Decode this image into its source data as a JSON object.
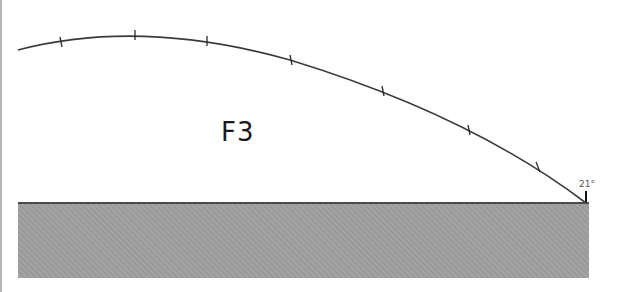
{
  "figure": {
    "label": "F3",
    "landing_label": "21°",
    "colors": {
      "trajectory": "#3a3a3a",
      "ground": "#a0a0a0",
      "ground_edge": "#4a4a4a",
      "frame": "#b5b5b5"
    },
    "trajectory": {
      "start": [
        18,
        50
      ],
      "apex": [
        135,
        35
      ],
      "end": [
        585,
        203
      ],
      "tick_positions": [
        [
          61,
          42
        ],
        [
          135,
          35
        ],
        [
          207,
          41
        ],
        [
          291,
          60
        ],
        [
          383,
          91
        ],
        [
          469,
          130
        ],
        [
          538,
          167
        ]
      ]
    }
  }
}
